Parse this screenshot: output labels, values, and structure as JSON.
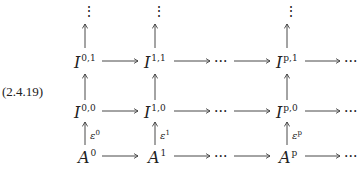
{
  "equation_number": "(2.4.19)",
  "nodes": {
    "I01": {
      "base": "I",
      "sup": "0,1"
    },
    "I11": {
      "base": "I",
      "sup": "1,1"
    },
    "Ip1": {
      "base": "I",
      "sup": "p,1"
    },
    "I00": {
      "base": "I",
      "sup": "0,0"
    },
    "I10": {
      "base": "I",
      "sup": "1,0"
    },
    "Ip0": {
      "base": "I",
      "sup": "p,0"
    },
    "A0": {
      "base": "A",
      "sup": "0"
    },
    "A1": {
      "base": "A",
      "sup": "1"
    },
    "Ap": {
      "base": "A",
      "sup": "p"
    }
  },
  "arrow_labels": {
    "e0": {
      "base": "ε",
      "sup": "0"
    },
    "e1": {
      "base": "ε",
      "sup": "1"
    },
    "ep": {
      "base": "ε",
      "sup": "p"
    }
  },
  "ellipsis_h": "···",
  "ellipsis_v": "⋮"
}
